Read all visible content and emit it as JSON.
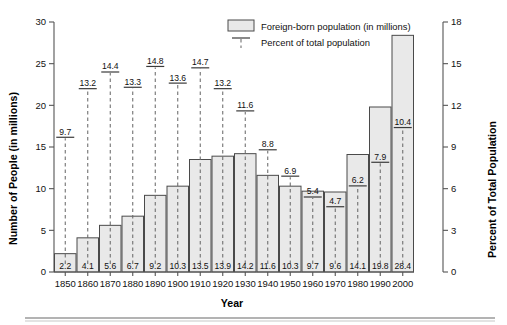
{
  "chart_data": {
    "type": "bar",
    "title": "",
    "xlabel": "Year",
    "ylabel": "Number of People (in millions)",
    "y2label": "Percent of Total Population",
    "categories": [
      "1850",
      "1860",
      "1870",
      "1880",
      "1890",
      "1900",
      "1910",
      "1920",
      "1930",
      "1940",
      "1950",
      "1960",
      "1970",
      "1980",
      "1990",
      "2000"
    ],
    "ylim": [
      0,
      30
    ],
    "yticks": [
      "0",
      "5",
      "10",
      "15",
      "20",
      "25",
      "30"
    ],
    "y2lim": [
      0,
      18
    ],
    "y2ticks": [
      "0",
      "3",
      "6",
      "9",
      "12",
      "15",
      "18"
    ],
    "grid": false,
    "legend_position": "top-right",
    "series": [
      {
        "name": "Foreign-born population (in millions)",
        "kind": "bar",
        "axis": "left",
        "values": [
          2.2,
          4.1,
          5.6,
          6.7,
          9.2,
          10.3,
          13.5,
          13.9,
          14.2,
          11.6,
          10.3,
          9.7,
          9.6,
          14.1,
          19.8,
          28.4
        ],
        "labels": [
          "2.2",
          "4.1",
          "5.6",
          "6.7",
          "9.2",
          "10.3",
          "13.5",
          "13.9",
          "14.2",
          "11.6",
          "10.3",
          "9.7",
          "9.6",
          "14.1",
          "19.8",
          "28.4"
        ]
      },
      {
        "name": "Percent of total population",
        "kind": "marker-dashed",
        "axis": "right",
        "values": [
          9.7,
          13.2,
          14.4,
          13.3,
          14.8,
          13.6,
          14.7,
          13.2,
          11.6,
          8.8,
          6.9,
          5.4,
          4.7,
          6.2,
          7.9,
          10.4
        ],
        "labels": [
          "9.7",
          "13.2",
          "14.4",
          "13.3",
          "14.8",
          "13.6",
          "14.7",
          "13.2",
          "11.6",
          "8.8",
          "6.9",
          "5.4",
          "4.7",
          "6.2",
          "7.9",
          "10.4"
        ]
      }
    ]
  },
  "legend": {
    "items": [
      {
        "label": "Foreign-born population (in millions)",
        "icon": "gray-box-swatch"
      },
      {
        "label": "Percent of total population",
        "icon": "dashed-line-swatch"
      }
    ]
  },
  "axes": {
    "left_title": "Number of People (in millions)",
    "right_title": "Percent of Total Population",
    "bottom_title": "Year"
  },
  "colors": {
    "bar_fill": "#e9e9e9",
    "bar_stroke": "#4a4a4a",
    "axis": "#555555",
    "text": "#111111",
    "dash": "#6b6b6b"
  }
}
